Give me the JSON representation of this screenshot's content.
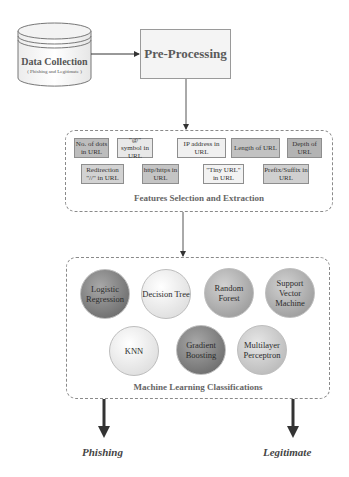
{
  "data_collection": {
    "title": "Data Collection",
    "subtitle": "( Phishing and Legitimate )"
  },
  "pre_processing": {
    "label": "Pre-Processing"
  },
  "features": {
    "caption": "Features Selection and Extraction",
    "row1": [
      {
        "label": "No. of dots in URL"
      },
      {
        "label": "\"@\" symbol in URL"
      },
      {
        "label": "IP address in URL"
      },
      {
        "label": "Length of URL"
      },
      {
        "label": "Depth of URL"
      }
    ],
    "row2": [
      {
        "label": "Redirection \"//\" in URL"
      },
      {
        "label": "http/https in URL"
      },
      {
        "label": "\"Tiny URL\" in URL"
      },
      {
        "label": "Prefix/Suffix in URL"
      }
    ]
  },
  "classifiers": {
    "caption": "Machine Learning Classifications",
    "row1": [
      {
        "label": "Logistic Regression"
      },
      {
        "label": "Decision Tree"
      },
      {
        "label": "Random Forest"
      },
      {
        "label": "Support Vector Machine"
      }
    ],
    "row2": [
      {
        "label": "KNN"
      },
      {
        "label": "Gradient Boosting"
      },
      {
        "label": "Multilayer Perceptron"
      }
    ]
  },
  "outcomes": {
    "left": "Phishing",
    "right": "Legitimate"
  }
}
